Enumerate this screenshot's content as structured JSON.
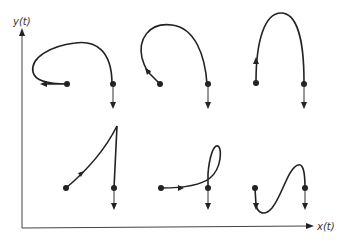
{
  "diagram": {
    "axes": {
      "x_label": "x(t)",
      "y_label": "y(t)"
    },
    "panels": [
      {
        "id": "top-left",
        "description": "curve loops up and back left from start point, arrow pointing left"
      },
      {
        "id": "top-middle",
        "description": "tall hook curve ending with arrow pointing up-left"
      },
      {
        "id": "top-right",
        "description": "symmetric arch curve, arrow pointing up on left leg"
      },
      {
        "id": "bottom-left",
        "description": "straight rising line to peak then vertical drop, arrow pointing up-right"
      },
      {
        "id": "bottom-middle",
        "description": "nearly flat curve with small loop at right, arrow pointing right"
      },
      {
        "id": "bottom-right",
        "description": "S-shaped curve dipping below start, arrow pointing down"
      }
    ],
    "colors": {
      "stroke": "#222222",
      "axis": "#444444",
      "background": "#ffffff"
    }
  }
}
